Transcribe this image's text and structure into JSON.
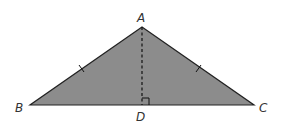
{
  "diagram": {
    "type": "isosceles-triangle-with-altitude",
    "fill_color": "#8c8c8c",
    "stroke_color": "#222222",
    "vertices": {
      "A": {
        "label": "A",
        "x": 142,
        "y": 27
      },
      "B": {
        "label": "B",
        "x": 30,
        "y": 105
      },
      "C": {
        "label": "C",
        "x": 254,
        "y": 105
      },
      "D": {
        "label": "D",
        "x": 142,
        "y": 105
      }
    },
    "labels": {
      "A": "A",
      "B": "B",
      "C": "C",
      "D": "D"
    },
    "segments": [
      {
        "from": "A",
        "to": "B",
        "style": "solid",
        "tick_marks": 1
      },
      {
        "from": "A",
        "to": "C",
        "style": "solid",
        "tick_marks": 1
      },
      {
        "from": "B",
        "to": "C",
        "style": "solid",
        "tick_marks": 0
      },
      {
        "from": "A",
        "to": "D",
        "style": "dashed",
        "tick_marks": 0
      }
    ],
    "right_angle_at": "D"
  }
}
